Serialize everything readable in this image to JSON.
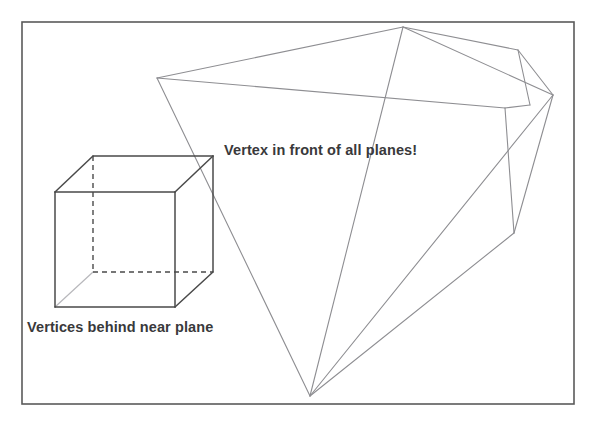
{
  "figure": {
    "background_color": "#ffffff",
    "border": {
      "name": "figure-border",
      "color": "#5a5a5a",
      "width": 1.6,
      "x": 22,
      "y": 22,
      "w": 552,
      "h": 382
    },
    "labels": [
      {
        "id": "vertex-in-front",
        "text": "Vertex in front of all planes!",
        "x": 224,
        "y": 143,
        "color": "#39393b",
        "font_size": 14.5
      },
      {
        "id": "vertices-behind",
        "text": "Vertices behind near plane",
        "x": 27,
        "y": 320,
        "color": "#39393b",
        "font_size": 14.5
      }
    ],
    "colors": {
      "frustum_stroke": "#8e8e92",
      "cube_solid_stroke": "#4a4a4a",
      "cube_hidden_stroke": "#4a4a4a",
      "cube_faint_stroke": "#b8b8bc",
      "border_stroke": "#5a5a5a",
      "text": "#39393b"
    },
    "cube": {
      "name": "cube-wireframe",
      "stroke_width": 1.5,
      "hidden_dash": "5,4",
      "front_face": [
        [
          55,
          192
        ],
        [
          175,
          192
        ],
        [
          175,
          307
        ],
        [
          55,
          307
        ]
      ],
      "back_face": [
        [
          93,
          156
        ],
        [
          213,
          156
        ],
        [
          213,
          272
        ],
        [
          93,
          272
        ]
      ],
      "solid_connectors": [
        [
          [
            55,
            192
          ],
          [
            93,
            156
          ]
        ],
        [
          [
            175,
            192
          ],
          [
            213,
            156
          ]
        ],
        [
          [
            175,
            307
          ],
          [
            213,
            272
          ]
        ]
      ],
      "faint_connectors": [
        [
          [
            55,
            307
          ],
          [
            93,
            272
          ]
        ]
      ],
      "hidden_edges": [
        [
          [
            93,
            156
          ],
          [
            93,
            272
          ]
        ],
        [
          [
            93,
            272
          ],
          [
            213,
            272
          ]
        ]
      ],
      "solid_back_edges": [
        [
          [
            93,
            156
          ],
          [
            213,
            156
          ]
        ],
        [
          [
            213,
            156
          ],
          [
            213,
            272
          ]
        ]
      ]
    },
    "frustum": {
      "name": "view-frustum-wireframe",
      "stroke_width": 1.1,
      "apex": [
        310,
        396
      ],
      "vertices": {
        "far_left": [
          157,
          78
        ],
        "far_top": [
          403,
          27
        ],
        "far_right_upper": [
          518,
          50
        ],
        "far_right_lower": [
          553,
          95
        ],
        "mid_right": [
          505,
          108
        ],
        "near_quad_bl": [
          530,
          105
        ],
        "low_right": [
          514,
          233
        ],
        "cross": [
          482,
          176
        ]
      },
      "edges": [
        [
          [
            157,
            78
          ],
          [
            403,
            27
          ]
        ],
        [
          [
            403,
            27
          ],
          [
            518,
            50
          ]
        ],
        [
          [
            157,
            78
          ],
          [
            505,
            108
          ]
        ],
        [
          [
            403,
            27
          ],
          [
            553,
            95
          ]
        ],
        [
          [
            518,
            50
          ],
          [
            553,
            95
          ]
        ],
        [
          [
            518,
            50
          ],
          [
            530,
            105
          ]
        ],
        [
          [
            505,
            108
          ],
          [
            530,
            105
          ]
        ],
        [
          [
            505,
            108
          ],
          [
            514,
            233
          ]
        ],
        [
          [
            553,
            95
          ],
          [
            514,
            233
          ]
        ],
        [
          [
            157,
            78
          ],
          [
            310,
            396
          ]
        ],
        [
          [
            403,
            27
          ],
          [
            310,
            396
          ]
        ],
        [
          [
            514,
            233
          ],
          [
            310,
            396
          ]
        ],
        [
          [
            553,
            95
          ],
          [
            310,
            396
          ]
        ]
      ]
    }
  }
}
